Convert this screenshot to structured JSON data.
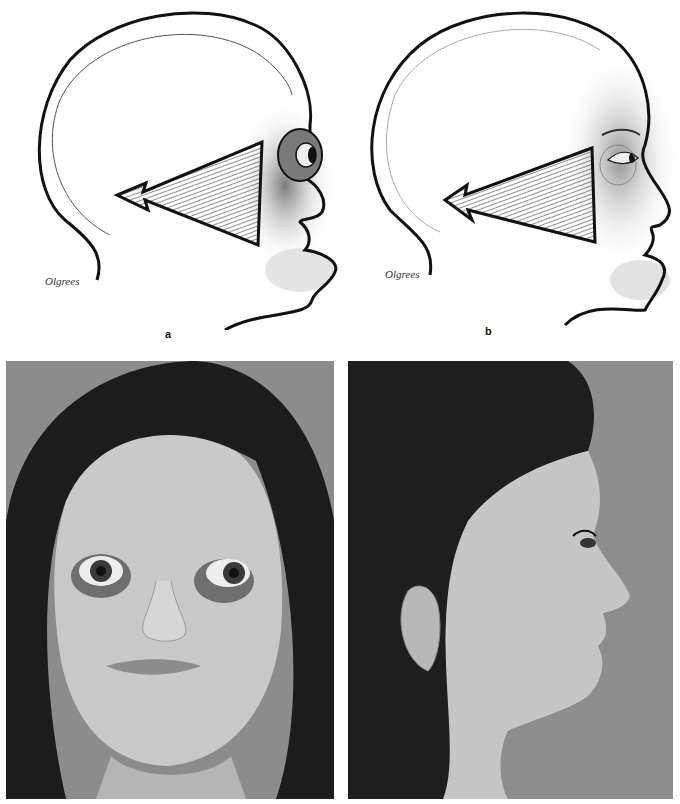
{
  "figure": {
    "panels": [
      {
        "id": "a",
        "label": "a",
        "type": "line-drawing",
        "view": "lateral head profile",
        "signature": "Olgrees",
        "description": "Profile drawing with hatched triangular arrow pointing posteriorly from the orbit; prominent protruding eye and shaded midface"
      },
      {
        "id": "b",
        "label": "b",
        "type": "line-drawing",
        "view": "lateral head profile",
        "signature": "Olgrees",
        "description": "Profile drawing with hatched triangular arrow pointing posteriorly from the orbit; normal eye position after correction"
      },
      {
        "id": "c",
        "label": "",
        "type": "photograph",
        "view": "frontal",
        "description": "Frontal photograph of patient with dark hair, prominent eyes with scleral show"
      },
      {
        "id": "d",
        "label": "",
        "type": "photograph",
        "view": "right lateral profile",
        "description": "Right profile photograph of patient"
      }
    ]
  },
  "colors": {
    "background": "#ffffff",
    "ink": "#111111",
    "photo_backdrop": "#8a8a8a",
    "skin_gray": "#c8c8c8",
    "hair": "#1a1a1a"
  }
}
